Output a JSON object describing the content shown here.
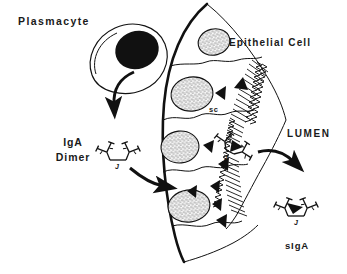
{
  "figure": {
    "type": "biological-schematic",
    "background_color": "#ffffff",
    "ink_color": "#111111",
    "width": 347,
    "height": 274
  },
  "labels": {
    "plasmacyte": "Plasmacyte",
    "epithelial_cell": "Epithelial Cell",
    "lumen": "LUMEN",
    "iga_line1": "IgA",
    "iga_line2": "Dimer",
    "sc": "sc",
    "siga": "sIgA",
    "j_chain": "J"
  },
  "structures": {
    "plasmacyte": {
      "name": "plasmacyte",
      "description": "oval plasma cell with large solid black eccentric nucleus",
      "nucleus_fill": "#111111",
      "cytoplasm_fill": "#ffffff"
    },
    "epithelium": {
      "name": "epithelial-layer",
      "cell_count": 4,
      "nucleus_style": "stippled oval",
      "basal_membrane": "thick curved line on left",
      "apical_surface": "microvilli brush border"
    },
    "secretory_component": {
      "name": "secretory-component",
      "glyph": "solid black triangle",
      "count_in_cells": 8
    },
    "iga_dimer": {
      "name": "iga-dimer",
      "units": 2,
      "joined_by": "J chain"
    },
    "siga": {
      "name": "secretory-iga",
      "units": 2,
      "joined_by": "J chain",
      "bound": "secretory component triangle"
    }
  },
  "arrows": [
    {
      "name": "secretion-arrow",
      "from": "plasmacyte",
      "to": "extracellular space",
      "direction": "down"
    },
    {
      "name": "uptake-arrow",
      "from": "iga-dimer",
      "to": "epithelial basolateral membrane",
      "direction": "right-down"
    },
    {
      "name": "release-arrow",
      "from": "apical membrane",
      "to": "lumen",
      "direction": "right"
    }
  ]
}
